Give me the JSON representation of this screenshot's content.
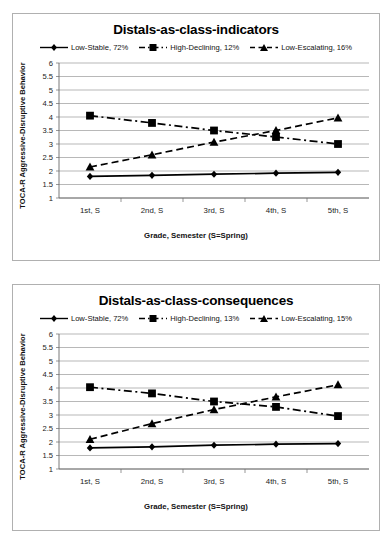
{
  "charts": [
    {
      "title": "Distals-as-class-indicators",
      "xlabel": "Grade, Semester (S=Spring)",
      "ylabel": "TOCA-R Aggressive-Disruptive Behavior",
      "legend": [
        {
          "label": "Low-Stable, 72%",
          "key": "diamond-solid-line"
        },
        {
          "label": "High-Declining, 12%",
          "key": "square-dashdot-line"
        },
        {
          "label": "Low-Escalating, 16%",
          "key": "triangle-dashed-line"
        }
      ],
      "chart_data": {
        "type": "line",
        "title": "Distals-as-class-indicators",
        "xlabel": "Grade, Semester (S=Spring)",
        "ylabel": "TOCA-R Aggressive-Disruptive Behavior",
        "categories": [
          "1st, S",
          "2nd, S",
          "3rd, S",
          "4th, S",
          "5th, S"
        ],
        "ylim": [
          1,
          6
        ],
        "yticks": [
          1,
          1.5,
          2,
          2.5,
          3,
          3.5,
          4,
          4.5,
          5,
          5.5,
          6
        ],
        "grid": true,
        "legend_position": "top",
        "series": [
          {
            "name": "Low-Stable, 72%",
            "marker": "diamond",
            "line": "solid",
            "values": [
              1.8,
              1.84,
              1.88,
              1.92,
              1.95
            ]
          },
          {
            "name": "High-Declining, 12%",
            "marker": "square",
            "line": "dash-dot",
            "values": [
              4.05,
              3.78,
              3.5,
              3.26,
              3.0
            ]
          },
          {
            "name": "Low-Escalating, 16%",
            "marker": "triangle",
            "line": "dashed",
            "values": [
              2.15,
              2.6,
              3.07,
              3.5,
              3.97
            ]
          }
        ]
      }
    },
    {
      "title": "Distals-as-class-consequences",
      "xlabel": "Grade, Semester (S=Spring)",
      "ylabel": "TOCA-R Aggressive-Disruptive Behavior",
      "legend": [
        {
          "label": "Low-Stable, 72%",
          "key": "diamond-solid-line"
        },
        {
          "label": "High-Declining, 13%",
          "key": "square-dashdot-line"
        },
        {
          "label": "Low-Escalating, 15%",
          "key": "triangle-dashed-line"
        }
      ],
      "chart_data": {
        "type": "line",
        "title": "Distals-as-class-consequences",
        "xlabel": "Grade, Semester (S=Spring)",
        "ylabel": "TOCA-R Aggressive-Disruptive Behavior",
        "categories": [
          "1st, S",
          "2nd, S",
          "3rd, S",
          "4th, S",
          "5th, S"
        ],
        "ylim": [
          1,
          6
        ],
        "yticks": [
          1,
          1.5,
          2,
          2.5,
          3,
          3.5,
          4,
          4.5,
          5,
          5.5,
          6
        ],
        "grid": true,
        "legend_position": "top",
        "series": [
          {
            "name": "Low-Stable, 72%",
            "marker": "diamond",
            "line": "solid",
            "values": [
              1.78,
              1.82,
              1.88,
              1.92,
              1.94
            ]
          },
          {
            "name": "High-Declining, 13%",
            "marker": "square",
            "line": "dash-dot",
            "values": [
              4.03,
              3.8,
              3.5,
              3.3,
              2.96
            ]
          },
          {
            "name": "Low-Escalating, 15%",
            "marker": "triangle",
            "line": "dashed",
            "values": [
              2.1,
              2.68,
              3.2,
              3.67,
              4.12
            ]
          }
        ]
      }
    }
  ]
}
